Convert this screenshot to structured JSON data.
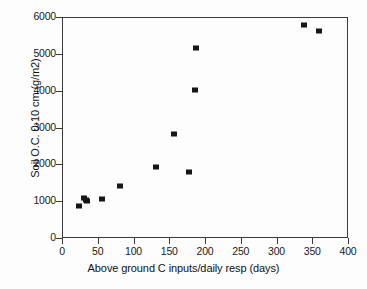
{
  "chart_data": {
    "type": "scatter",
    "title": "",
    "xlabel": "Above ground C inputs/daily resp (days)",
    "ylabel": "Soil O.C. 0-10 cm (g/m2)",
    "xlim": [
      0,
      400
    ],
    "ylim": [
      0,
      6000
    ],
    "xticks": [
      0,
      50,
      100,
      150,
      200,
      250,
      300,
      350,
      400
    ],
    "yticks": [
      0,
      1000,
      2000,
      3000,
      4000,
      5000,
      6000
    ],
    "grid": false,
    "legend": null,
    "marker": "filled-square",
    "marker_color": "#161616",
    "series": [
      {
        "name": "Soil organic carbon vs C input turnover",
        "points": [
          {
            "x": 24,
            "y": 870
          },
          {
            "x": 31,
            "y": 1080
          },
          {
            "x": 33,
            "y": 1020
          },
          {
            "x": 35,
            "y": 1010
          },
          {
            "x": 56,
            "y": 1050
          },
          {
            "x": 81,
            "y": 1420
          },
          {
            "x": 132,
            "y": 1930
          },
          {
            "x": 156,
            "y": 2820
          },
          {
            "x": 177,
            "y": 1780
          },
          {
            "x": 186,
            "y": 4010
          },
          {
            "x": 188,
            "y": 5170
          },
          {
            "x": 338,
            "y": 5770
          },
          {
            "x": 360,
            "y": 5610
          }
        ]
      }
    ]
  },
  "axes": {
    "x_tick_labels": [
      "0",
      "50",
      "100",
      "150",
      "200",
      "250",
      "300",
      "350",
      "400"
    ],
    "y_tick_labels": [
      "0",
      "1000",
      "2000",
      "3000",
      "4000",
      "5000",
      "6000"
    ]
  },
  "colors": {
    "marker": "#161616",
    "axis": "#3a3a3a",
    "text": "#111111",
    "background": "#fdfdfd"
  }
}
